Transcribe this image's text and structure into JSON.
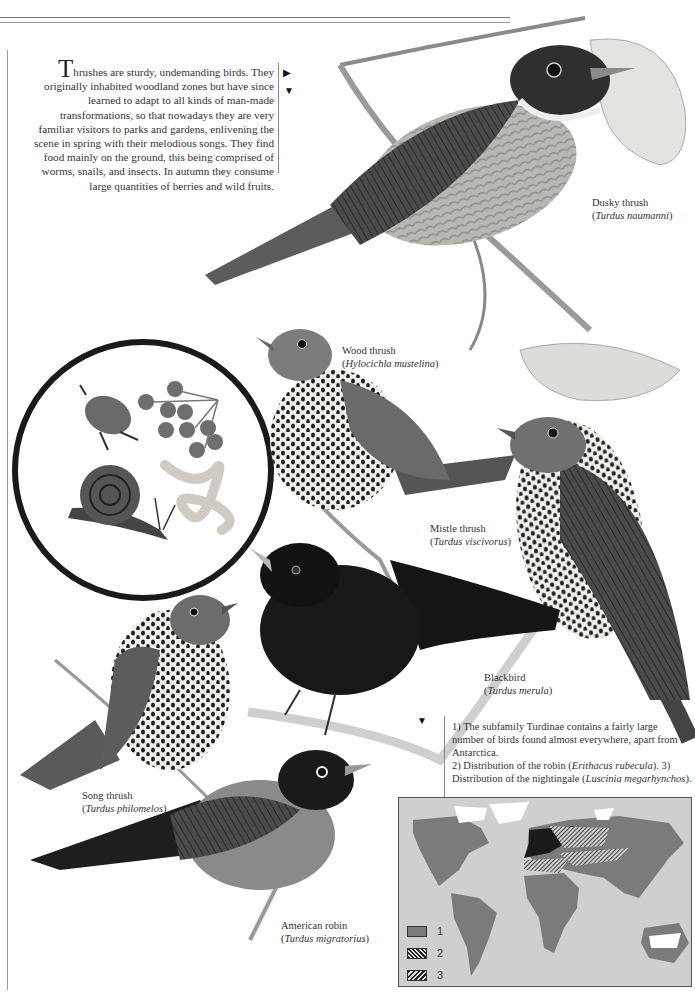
{
  "page": {
    "intro": {
      "dropcap": "T",
      "text": "hrushes are sturdy, undemanding birds. They originally inhabited woodland zones but have since learned to adapt to all kinds of man-made transformations, so that nowadays they are very familiar visitors to parks and gardens, enlivening the scene in spring with their melodious songs. They find food mainly on the ground, this being comprised of worms, snails, and insects. In autumn they consume large quantities of berries and wild fruits.",
      "markers": [
        "right-triangle",
        "down-triangle"
      ]
    },
    "food_inset": {
      "items": [
        "beetle",
        "berries",
        "snail",
        "worm"
      ]
    },
    "birds": [
      {
        "common": "Dusky thrush",
        "scientific": "Turdus naumanni"
      },
      {
        "common": "Wood thrush",
        "scientific": "Hylocichla mustelina"
      },
      {
        "common": "Mistle thrush",
        "scientific": "Turdus viscivorus"
      },
      {
        "common": "Blackbird",
        "scientific": "Turdus merula"
      },
      {
        "common": "Song thrush",
        "scientific": "Turdus philomelos"
      },
      {
        "common": "American robin",
        "scientific": "Turdus migratorius"
      }
    ],
    "map_note": {
      "marker": "down-triangle",
      "p1": "1) The subfamily Turdinae contains a fairly large number of birds found almost everywhere, apart from Antarctica.",
      "p2_a": "2) Distribution of the robin (",
      "p2_sci": "Erithacus rubecula",
      "p2_b": "). 3) Distribution of the nightingale (",
      "p3_sci": "Luscinia megarhynchos",
      "p3_b": ")."
    },
    "map": {
      "legend": [
        {
          "key": "1",
          "pattern": "solid-gray"
        },
        {
          "key": "2",
          "pattern": "hatch-dense"
        },
        {
          "key": "3",
          "pattern": "hatch-diagonal"
        }
      ],
      "colors": {
        "ocean": "#cfcfcf",
        "land": "#7b7b7b",
        "ice": "#ffffff",
        "hatch": "#222222"
      }
    }
  }
}
